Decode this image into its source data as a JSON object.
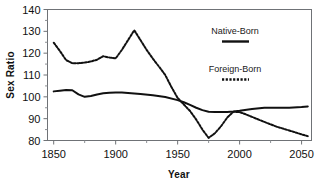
{
  "chart_data": {
    "type": "line",
    "title": "",
    "xlabel": "Year",
    "ylabel": "Sex Ratio",
    "xlim": [
      1845,
      2058
    ],
    "ylim": [
      80,
      140
    ],
    "xticks": [
      1850,
      1900,
      1950,
      2000,
      2050
    ],
    "xtick_labels": [
      "1850",
      "1900",
      "1950",
      "2000",
      "2050"
    ],
    "x_minor_ticks": [
      1875,
      1925,
      1975,
      2025
    ],
    "yticks": [
      80,
      90,
      100,
      110,
      120,
      130,
      140
    ],
    "ytick_labels": [
      "80",
      "90",
      "100",
      "110",
      "120",
      "130",
      "140"
    ],
    "grid": false,
    "legend_position": "inside-upper-right",
    "series": [
      {
        "name": "Native-Born",
        "style": "solid",
        "color": "#111111",
        "x": [
          1850,
          1855,
          1860,
          1865,
          1870,
          1875,
          1880,
          1885,
          1890,
          1895,
          1900,
          1905,
          1910,
          1920,
          1930,
          1940,
          1950,
          1955,
          1960,
          1965,
          1970,
          1975,
          1980,
          1985,
          1990,
          1995,
          2000,
          2010,
          2020,
          2030,
          2040,
          2050,
          2055
        ],
        "values": [
          102.5,
          102.8,
          103.1,
          103.0,
          101.1,
          100.0,
          100.4,
          101.1,
          101.6,
          101.9,
          102.0,
          102.0,
          101.8,
          101.3,
          100.7,
          99.9,
          98.5,
          97.5,
          96.3,
          95.0,
          93.9,
          93.2,
          93.0,
          93.0,
          93.1,
          93.3,
          93.6,
          94.4,
          95.0,
          95.0,
          95.0,
          95.3,
          95.6
        ]
      },
      {
        "name": "Foreign-Born",
        "style": "dotted",
        "color": "#111111",
        "x": [
          1850,
          1855,
          1860,
          1865,
          1870,
          1875,
          1880,
          1885,
          1890,
          1895,
          1900,
          1905,
          1910,
          1915,
          1920,
          1925,
          1930,
          1935,
          1940,
          1945,
          1950,
          1955,
          1960,
          1965,
          1970,
          1975,
          1980,
          1985,
          1990,
          1995,
          2000,
          2005,
          2010,
          2020,
          2030,
          2040,
          2050,
          2055
        ],
        "values": [
          124.8,
          121.0,
          116.8,
          115.4,
          115.4,
          115.7,
          116.2,
          117.0,
          118.6,
          118.0,
          117.6,
          121.5,
          126.0,
          130.5,
          126.0,
          121.5,
          117.5,
          113.8,
          110.0,
          104.5,
          99.5,
          96.5,
          93.5,
          89.6,
          85.0,
          81.2,
          83.3,
          86.5,
          90.5,
          93.2,
          93.0,
          92.0,
          90.8,
          88.5,
          86.3,
          84.6,
          82.8,
          82.0
        ]
      }
    ],
    "annotations": []
  },
  "legend": {
    "entries": [
      {
        "label": "Native-Born",
        "style": "solid"
      },
      {
        "label": "Foreign-Born",
        "style": "dotted"
      }
    ]
  }
}
